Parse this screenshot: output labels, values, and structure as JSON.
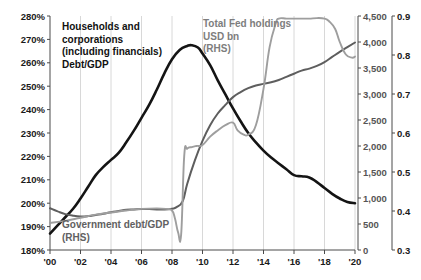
{
  "chart_data": {
    "type": "line",
    "title": "",
    "xlabel": "",
    "x_ticks": [
      "'00",
      "'02",
      "'04",
      "'06",
      "'08",
      "'10",
      "'12",
      "'14",
      "'16",
      "'18",
      "'20"
    ],
    "x_range": [
      2000,
      2020
    ],
    "axes": {
      "left": {
        "label": "",
        "ticks": [
          "180%",
          "190%",
          "200%",
          "210%",
          "220%",
          "230%",
          "240%",
          "250%",
          "260%",
          "270%",
          "280%"
        ],
        "range": [
          180,
          280
        ],
        "unit": "%"
      },
      "right_inner": {
        "label": "USD bn",
        "ticks": [
          "0",
          "500",
          "1,000",
          "1,500",
          "2,000",
          "2,500",
          "3,000",
          "3,500",
          "4,000",
          "4,500"
        ],
        "range": [
          0,
          4500
        ],
        "unit": "USD bn"
      },
      "right_outer": {
        "label": "",
        "ticks": [
          "0.3",
          "0.4",
          "0.5",
          "0.6",
          "0.7",
          "0.8",
          "0.9"
        ],
        "range": [
          0.3,
          0.9
        ],
        "unit": "ratio"
      }
    },
    "grid": "vertical",
    "legend_position": "inline-annotations",
    "series": [
      {
        "name": "Households and corporations (including financials) Debt/GDP",
        "axis": "left",
        "color": "#141414",
        "x": [
          2000,
          2000.5,
          2001,
          2001.5,
          2002,
          2002.5,
          2003,
          2003.5,
          2004,
          2004.5,
          2005,
          2005.5,
          2006,
          2006.5,
          2007,
          2007.5,
          2008,
          2008.5,
          2009,
          2009.3,
          2009.7,
          2010,
          2010.5,
          2011,
          2011.5,
          2012,
          2012.5,
          2013,
          2013.5,
          2014,
          2014.5,
          2015,
          2015.5,
          2016,
          2016.5,
          2017,
          2017.5,
          2018,
          2018.5,
          2019,
          2019.5,
          2020
        ],
        "y": [
          187.0,
          190.5,
          194.0,
          197.5,
          202.0,
          207.0,
          212.0,
          215.5,
          218.5,
          221.5,
          226.0,
          231.0,
          236.5,
          242.0,
          248.5,
          255.5,
          261.5,
          265.5,
          267.2,
          267.5,
          266.5,
          264.0,
          259.0,
          252.5,
          246.5,
          240.5,
          235.0,
          230.0,
          226.0,
          222.5,
          219.5,
          217.0,
          214.5,
          212.0,
          211.5,
          211.0,
          209.0,
          206.5,
          204.0,
          202.0,
          200.5,
          200.0
        ]
      },
      {
        "name": "Government debt/GDP (RHS)",
        "axis": "right_outer",
        "color": "#5e5e5e",
        "x": [
          2000,
          2000.5,
          2001,
          2001.5,
          2002,
          2002.5,
          2003,
          2003.5,
          2004,
          2004.5,
          2005,
          2005.5,
          2006,
          2006.5,
          2007,
          2007.5,
          2008,
          2008.3,
          2008.7,
          2009,
          2009.5,
          2010,
          2010.5,
          2011,
          2011.5,
          2012,
          2012.5,
          2013,
          2013.5,
          2014,
          2014.5,
          2015,
          2015.5,
          2016,
          2016.5,
          2017,
          2017.5,
          2018,
          2018.5,
          2019,
          2019.5,
          2020
        ],
        "y": [
          0.407,
          0.399,
          0.392,
          0.388,
          0.386,
          0.387,
          0.39,
          0.393,
          0.397,
          0.4,
          0.403,
          0.404,
          0.405,
          0.405,
          0.404,
          0.404,
          0.406,
          0.41,
          0.425,
          0.47,
          0.53,
          0.58,
          0.62,
          0.65,
          0.672,
          0.692,
          0.705,
          0.715,
          0.722,
          0.726,
          0.73,
          0.736,
          0.744,
          0.752,
          0.76,
          0.765,
          0.772,
          0.782,
          0.795,
          0.808,
          0.82,
          0.832
        ]
      },
      {
        "name": "Total Fed holdings USD bn (RHS)",
        "axis": "right_inner",
        "color": "#9e9e9e",
        "x": [
          2000,
          2001,
          2002,
          2003,
          2004,
          2005,
          2006,
          2007,
          2007.6,
          2008,
          2008.2,
          2008.4,
          2008.6,
          2008.8,
          2009,
          2009.3,
          2009.6,
          2010,
          2010.5,
          2011,
          2011.5,
          2012,
          2012.3,
          2012.7,
          2013,
          2013.5,
          2014,
          2014.4,
          2014.8,
          2015,
          2015.5,
          2016,
          2016.5,
          2017,
          2017.5,
          2018,
          2018.3,
          2018.7,
          2019,
          2019.4,
          2019.8,
          2020
        ],
        "y": [
          520,
          560,
          620,
          680,
          720,
          760,
          790,
          800,
          790,
          760,
          600,
          340,
          300,
          1800,
          1950,
          1980,
          2000,
          2020,
          2180,
          2300,
          2400,
          2450,
          2300,
          2220,
          2220,
          2400,
          3100,
          3900,
          4350,
          4450,
          4450,
          4450,
          4450,
          4450,
          4460,
          4450,
          4400,
          4250,
          4000,
          3760,
          3700,
          3720
        ]
      }
    ],
    "annotations": [
      {
        "id": "ann-households",
        "lines": [
          "Households and",
          "corporations",
          "(including financials)",
          "Debt/GDP"
        ],
        "style": "black"
      },
      {
        "id": "ann-fed",
        "lines": [
          "Total Fed holdings",
          "USD bn",
          "(RHS)"
        ],
        "style": "light-gray"
      },
      {
        "id": "ann-government",
        "lines": [
          "Government debt/GDP",
          "(RHS)"
        ],
        "style": "dark-gray"
      }
    ]
  }
}
